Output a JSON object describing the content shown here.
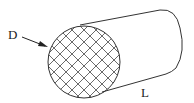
{
  "diagram": {
    "type": "cylinder",
    "labels": {
      "diameter": "D",
      "length": "L"
    },
    "colors": {
      "stroke": "#333333",
      "hatch": "#444444",
      "background": "#ffffff"
    },
    "end_face": {
      "fill": "cross-hatch"
    }
  }
}
